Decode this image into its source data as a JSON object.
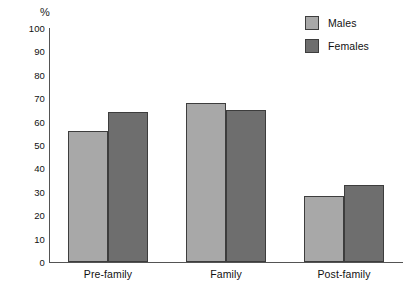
{
  "chart_data": {
    "type": "bar",
    "title": "",
    "xlabel": "",
    "ylabel": "%",
    "ylim": [
      0,
      100
    ],
    "ytick_step": 10,
    "yticks": [
      100,
      90,
      80,
      70,
      60,
      50,
      40,
      30,
      20,
      10,
      0
    ],
    "grid": false,
    "legend_position": "top-right",
    "categories": [
      "Pre-family",
      "Family",
      "Post-family"
    ],
    "series": [
      {
        "name": "Males",
        "color": "#a8a8a8",
        "values": [
          56,
          68,
          28
        ]
      },
      {
        "name": "Females",
        "color": "#6e6e6e",
        "values": [
          64,
          65,
          33
        ]
      }
    ]
  },
  "axis": {
    "unit_label": "%"
  },
  "legend": {
    "items": [
      {
        "label": "Males",
        "color": "#a8a8a8"
      },
      {
        "label": "Females",
        "color": "#6e6e6e"
      }
    ]
  }
}
